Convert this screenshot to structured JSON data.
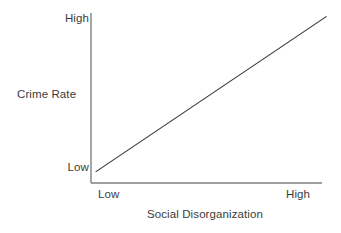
{
  "chart_data": {
    "type": "line",
    "title": "",
    "subtitle": "",
    "xlabel": "Social Disorganization",
    "ylabel": "Crime Rate",
    "x_tick_labels": [
      "Low",
      "High"
    ],
    "y_tick_labels": [
      "Low",
      "High"
    ],
    "xlim": [
      0,
      1
    ],
    "ylim": [
      0,
      1
    ],
    "grid": false,
    "legend": false,
    "legend_position": "none",
    "annotations": [],
    "series": [
      {
        "name": "Crime Rate vs Social Disorganization",
        "x": [
          0.02,
          1.02
        ],
        "values": [
          0.065,
          0.98
        ],
        "style": "solid-straight-positive-slope",
        "color": "#333333"
      }
    ],
    "axis_color": "#808080",
    "text_color": "#3c3c3c",
    "background": "#ffffff"
  },
  "figure": {
    "y_axis_title": "Crime Rate",
    "y_tick_top": "High",
    "y_tick_bottom": "Low",
    "x_axis_title": "Social Disorganization",
    "x_tick_left": "Low",
    "x_tick_right": "High"
  }
}
